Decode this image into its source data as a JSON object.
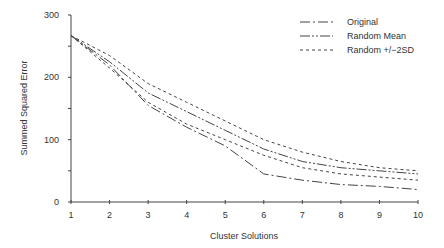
{
  "chart_data": {
    "type": "line",
    "title": "",
    "xlabel": "Cluster Solutions",
    "ylabel": "Summed Squared Error",
    "x": [
      1,
      2,
      3,
      4,
      5,
      6,
      7,
      8,
      9,
      10
    ],
    "xlim": [
      1,
      10
    ],
    "ylim": [
      0,
      300
    ],
    "yticks": [
      0,
      100,
      200,
      300
    ],
    "xticks": [
      1,
      2,
      3,
      4,
      5,
      6,
      7,
      8,
      9,
      10
    ],
    "grid": false,
    "legend_position": "upper right",
    "series": [
      {
        "name": "Original",
        "style": "dash-dot",
        "values": [
          267,
          220,
          155,
          120,
          90,
          45,
          35,
          28,
          25,
          20
        ]
      },
      {
        "name": "Random Mean",
        "style": "dash-dot-dot",
        "values": [
          267,
          225,
          175,
          145,
          115,
          85,
          65,
          55,
          50,
          45
        ]
      },
      {
        "name": "Random +/−2SD",
        "style": "dashed",
        "values": [
          267,
          235,
          190,
          160,
          130,
          100,
          80,
          65,
          55,
          50
        ]
      },
      {
        "name": "Random +/−2SD lower",
        "style": "dashed",
        "values": [
          267,
          215,
          160,
          125,
          100,
          75,
          55,
          45,
          40,
          35
        ]
      }
    ]
  },
  "legend": [
    {
      "label": "Original"
    },
    {
      "label": "Random Mean"
    },
    {
      "label": "Random +/−2SD"
    }
  ]
}
